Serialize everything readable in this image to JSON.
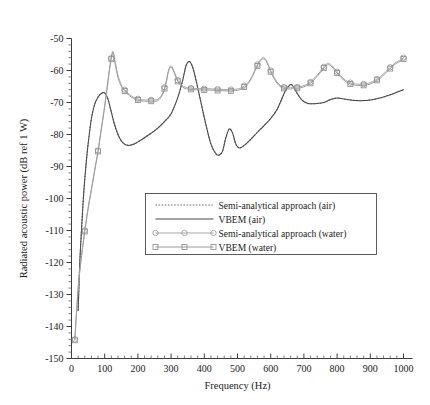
{
  "chart_data": {
    "type": "line",
    "title": "",
    "xlabel": "Frequency (Hz)",
    "ylabel": "Radiated acoustic power (dB ref 1 W)",
    "xlim": [
      0,
      1000
    ],
    "ylim": [
      -150,
      -50
    ],
    "xticks": [
      0,
      100,
      200,
      300,
      400,
      500,
      600,
      700,
      800,
      900,
      1000
    ],
    "yticks": [
      -50,
      -60,
      -70,
      -80,
      -90,
      -100,
      -110,
      -120,
      -130,
      -140,
      -150
    ],
    "xtick_labels": [
      "0",
      "100",
      "200",
      "300",
      "400",
      "500",
      "600",
      "700",
      "800",
      "900",
      "1000"
    ],
    "ytick_labels": [
      "-50",
      "-60",
      "-70",
      "-80",
      "-90",
      "-100",
      "-110",
      "-120",
      "-130",
      "-140",
      "-150"
    ],
    "x_minor_ticks_per_major": 5,
    "y_minor_ticks_per_major": 5,
    "grid": false,
    "legend_position": "center",
    "series": [
      {
        "name": "Semi-analytical approach (air)",
        "style": "dotted",
        "color": "#6e6e6e",
        "marker": "none",
        "x": [
          20,
          25,
          30,
          35,
          40,
          45,
          50,
          60,
          70,
          80,
          90,
          100,
          110,
          120,
          130,
          140,
          150,
          160,
          170,
          180,
          190,
          200,
          220,
          240,
          260,
          280,
          300,
          320,
          335,
          345,
          355,
          365,
          375,
          390,
          405,
          420,
          435,
          445,
          455,
          465,
          475,
          485,
          495,
          505,
          515,
          525,
          540,
          560,
          580,
          600,
          620,
          635,
          645,
          655,
          662,
          670,
          680,
          695,
          710,
          725,
          740,
          760,
          780,
          800,
          820,
          840,
          860,
          880,
          900,
          920,
          940,
          960,
          980,
          1000
        ],
        "y": [
          -135.0,
          -120.0,
          -110.0,
          -101.0,
          -94.0,
          -88.0,
          -83.0,
          -75.0,
          -70.5,
          -68.3,
          -67.2,
          -67.0,
          -69.0,
          -73.0,
          -77.0,
          -80.0,
          -82.0,
          -83.0,
          -83.4,
          -83.3,
          -82.9,
          -82.3,
          -81.0,
          -79.6,
          -78.0,
          -76.0,
          -73.5,
          -68.5,
          -63.0,
          -58.5,
          -57.2,
          -59.0,
          -63.0,
          -70.0,
          -77.0,
          -83.0,
          -86.0,
          -86.4,
          -85.2,
          -81.0,
          -78.3,
          -79.5,
          -83.0,
          -84.2,
          -83.8,
          -83.0,
          -81.5,
          -79.3,
          -77.2,
          -75.0,
          -72.0,
          -68.5,
          -66.2,
          -64.8,
          -64.4,
          -65.3,
          -67.2,
          -69.3,
          -70.2,
          -70.4,
          -70.3,
          -70.0,
          -69.1,
          -68.6,
          -68.9,
          -69.2,
          -69.4,
          -69.4,
          -69.2,
          -68.8,
          -68.3,
          -67.6,
          -66.8,
          -66.0
        ]
      },
      {
        "name": "VBEM (air)",
        "style": "solid",
        "color": "#4a4a4a",
        "marker": "none",
        "x": [
          20,
          25,
          30,
          35,
          40,
          45,
          50,
          60,
          70,
          80,
          90,
          100,
          110,
          120,
          130,
          140,
          150,
          160,
          170,
          180,
          190,
          200,
          220,
          240,
          260,
          280,
          300,
          320,
          335,
          345,
          355,
          365,
          375,
          390,
          405,
          420,
          435,
          445,
          455,
          465,
          475,
          485,
          495,
          505,
          515,
          525,
          540,
          560,
          580,
          600,
          620,
          635,
          645,
          655,
          662,
          670,
          680,
          695,
          710,
          725,
          740,
          760,
          780,
          800,
          820,
          840,
          860,
          880,
          900,
          920,
          940,
          960,
          980,
          1000
        ],
        "y": [
          -135.0,
          -120.0,
          -110.0,
          -101.0,
          -94.0,
          -88.0,
          -83.0,
          -75.0,
          -70.5,
          -68.3,
          -67.2,
          -67.0,
          -69.0,
          -73.0,
          -77.0,
          -80.0,
          -82.0,
          -83.0,
          -83.4,
          -83.3,
          -82.9,
          -82.3,
          -81.0,
          -79.6,
          -78.0,
          -76.0,
          -73.5,
          -68.5,
          -63.0,
          -58.5,
          -57.2,
          -59.0,
          -63.0,
          -70.0,
          -77.0,
          -83.0,
          -86.0,
          -86.4,
          -85.2,
          -81.0,
          -78.3,
          -79.5,
          -83.0,
          -84.2,
          -83.8,
          -83.0,
          -81.5,
          -79.3,
          -77.2,
          -75.0,
          -72.0,
          -68.5,
          -66.2,
          -64.8,
          -64.4,
          -65.3,
          -67.2,
          -69.3,
          -70.2,
          -70.4,
          -70.3,
          -70.0,
          -69.1,
          -68.6,
          -68.9,
          -69.2,
          -69.4,
          -69.4,
          -69.2,
          -68.8,
          -68.3,
          -67.6,
          -66.8,
          -66.0
        ]
      },
      {
        "name": "Semi-analytical approach (water)",
        "style": "solid",
        "color": "#a8a8a8",
        "marker": "circle",
        "marker_interval_hz": 40,
        "x": [
          10,
          20,
          30,
          40,
          50,
          60,
          70,
          80,
          90,
          100,
          110,
          118,
          125,
          132,
          140,
          150,
          160,
          175,
          190,
          205,
          220,
          240,
          260,
          275,
          285,
          292,
          300,
          310,
          320,
          335,
          350,
          370,
          390,
          410,
          430,
          450,
          470,
          490,
          510,
          530,
          545,
          558,
          570,
          580,
          590,
          600,
          612,
          625,
          640,
          655,
          665,
          675,
          690,
          705,
          720,
          735,
          750,
          762,
          772,
          782,
          795,
          810,
          825,
          840,
          855,
          870,
          885,
          900,
          915,
          930,
          945,
          960,
          975,
          985,
          995,
          1000
        ],
        "y": [
          -144.0,
          -128.0,
          -118.0,
          -110.0,
          -103.0,
          -97.0,
          -91.0,
          -85.0,
          -78.0,
          -71.0,
          -63.0,
          -57.0,
          -54.0,
          -57.5,
          -61.5,
          -64.5,
          -66.0,
          -67.5,
          -68.5,
          -69.0,
          -69.2,
          -69.2,
          -69.0,
          -67.0,
          -63.5,
          -60.0,
          -58.5,
          -60.5,
          -63.0,
          -64.8,
          -65.4,
          -65.6,
          -65.7,
          -65.7,
          -65.8,
          -65.9,
          -66.0,
          -65.9,
          -65.5,
          -64.0,
          -61.5,
          -58.5,
          -56.5,
          -56.0,
          -57.5,
          -60.0,
          -62.5,
          -64.3,
          -65.2,
          -65.4,
          -65.3,
          -65.2,
          -65.0,
          -64.5,
          -63.6,
          -62.0,
          -60.2,
          -58.6,
          -57.8,
          -58.2,
          -59.8,
          -61.6,
          -63.0,
          -63.8,
          -64.2,
          -64.3,
          -64.2,
          -63.8,
          -63.0,
          -62.0,
          -60.5,
          -59.0,
          -57.6,
          -57.0,
          -56.4,
          -56.0
        ]
      },
      {
        "name": "VBEM (water)",
        "style": "solid",
        "color": "#9c9c9c",
        "marker": "square",
        "marker_interval_hz": 40,
        "x": [
          10,
          20,
          30,
          40,
          50,
          60,
          70,
          80,
          90,
          100,
          110,
          118,
          125,
          132,
          140,
          150,
          160,
          175,
          190,
          205,
          220,
          240,
          260,
          275,
          285,
          292,
          300,
          310,
          320,
          335,
          350,
          370,
          390,
          410,
          430,
          450,
          470,
          490,
          510,
          530,
          545,
          558,
          570,
          580,
          590,
          600,
          612,
          625,
          640,
          655,
          665,
          675,
          690,
          705,
          720,
          735,
          750,
          762,
          772,
          782,
          795,
          810,
          825,
          840,
          855,
          870,
          885,
          900,
          915,
          930,
          945,
          960,
          975,
          985,
          995,
          1000
        ],
        "y": [
          -144.3,
          -128.3,
          -118.3,
          -110.3,
          -103.3,
          -97.3,
          -91.3,
          -85.3,
          -78.3,
          -71.3,
          -63.3,
          -57.3,
          -54.4,
          -58.2,
          -62.2,
          -65.0,
          -66.4,
          -67.9,
          -68.9,
          -69.4,
          -69.6,
          -69.6,
          -69.4,
          -67.4,
          -63.9,
          -60.4,
          -58.9,
          -60.9,
          -63.4,
          -65.2,
          -65.8,
          -66.0,
          -66.1,
          -66.1,
          -66.2,
          -66.3,
          -66.4,
          -66.3,
          -65.9,
          -64.4,
          -61.9,
          -58.9,
          -56.9,
          -56.4,
          -57.9,
          -60.4,
          -62.9,
          -64.7,
          -65.6,
          -65.8,
          -65.7,
          -65.6,
          -65.4,
          -64.9,
          -64.0,
          -62.4,
          -60.6,
          -59.0,
          -58.2,
          -58.6,
          -60.2,
          -62.0,
          -63.4,
          -64.2,
          -64.6,
          -64.7,
          -64.6,
          -64.2,
          -63.4,
          -62.4,
          -60.9,
          -59.4,
          -58.0,
          -57.4,
          -56.8,
          -56.4
        ]
      }
    ],
    "legend_entries": [
      {
        "label": "Semi-analytical approach (air)",
        "style": "dotted",
        "marker": "none",
        "color": "#6e6e6e"
      },
      {
        "label": "VBEM (air)",
        "style": "solid",
        "marker": "none",
        "color": "#4a4a4a"
      },
      {
        "label": "Semi-analytical approach (water)",
        "style": "solid",
        "marker": "circle",
        "color": "#a8a8a8"
      },
      {
        "label": "VBEM (water)",
        "style": "solid",
        "marker": "square",
        "color": "#9c9c9c"
      }
    ]
  }
}
